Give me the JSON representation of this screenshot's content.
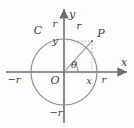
{
  "figure": {
    "type": "unit-circle-trigonometry-diagram",
    "title": "",
    "colors": {
      "background": "#fdfdfd",
      "axis": "#6e6e6e",
      "circle": "#8a8a8a",
      "radius_line": "#8a8a8a",
      "dotted_guide": "#b0b0b0",
      "label_text": "#3b3b3b"
    },
    "geometry": {
      "center": {
        "x": 64,
        "y": 72
      },
      "radius_px": 33,
      "point_p": {
        "x": 92,
        "y": 41
      },
      "angle_theta_deg": 48,
      "x_axis": {
        "x1": 6,
        "x2": 128,
        "y": 72
      },
      "y_axis": {
        "y1": 8,
        "y2": 123,
        "x": 64
      }
    },
    "labels": {
      "circle_name": "C",
      "origin": "O",
      "point": "P",
      "angle": "θ",
      "axis_x": "x",
      "axis_y": "y",
      "radius_on_x_right": "r",
      "radius_on_x_left": "−r",
      "radius_on_y_top": "r",
      "radius_on_y_bottom": "−r",
      "coord_x": "x",
      "coord_y": "y",
      "radius_segment": "r"
    },
    "label_positions": {
      "circle_name": {
        "x": 38,
        "y": 30
      },
      "origin": {
        "x": 55,
        "y": 80
      },
      "point": {
        "x": 101,
        "y": 33
      },
      "angle": {
        "x": 74,
        "y": 65
      },
      "axis_x": {
        "x": 124,
        "y": 62
      },
      "axis_y": {
        "x": 72,
        "y": 14
      },
      "radius_on_x_right": {
        "x": 104,
        "y": 80
      },
      "radius_on_x_left": {
        "x": 14,
        "y": 80
      },
      "radius_on_y_top": {
        "x": 55,
        "y": 24
      },
      "radius_on_y_bottom": {
        "x": 56,
        "y": 113
      },
      "coord_x": {
        "x": 89,
        "y": 81
      },
      "coord_y": {
        "x": 55,
        "y": 41
      },
      "radius_segment": {
        "x": 79,
        "y": 26
      }
    }
  }
}
